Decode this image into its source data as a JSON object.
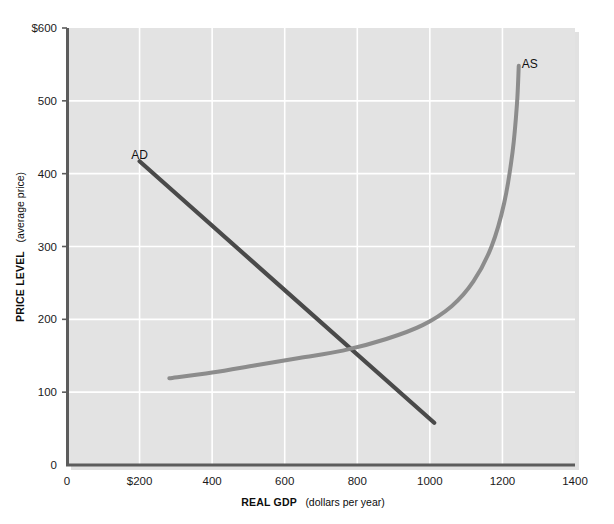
{
  "chart_data": {
    "type": "line",
    "title": "",
    "xlabel": "REAL GDP (dollars per year)",
    "xlabel_bold": "REAL GDP",
    "xlabel_paren": "(dollars per year)",
    "ylabel": "PRICE LEVEL (average price)",
    "ylabel_bold": "PRICE LEVEL",
    "ylabel_paren": "(average price)",
    "xlim": [
      0,
      1400
    ],
    "ylim": [
      0,
      600
    ],
    "xticks": [
      "0",
      "$200",
      "400",
      "600",
      "800",
      "1000",
      "1200",
      "1400"
    ],
    "xtick_values": [
      0,
      200,
      400,
      600,
      800,
      1000,
      1200,
      1400
    ],
    "yticks": [
      "0",
      "100",
      "200",
      "300",
      "400",
      "500",
      "$600"
    ],
    "ytick_values": [
      0,
      100,
      200,
      300,
      400,
      500,
      600
    ],
    "grid": true,
    "grid_color": "#ffffff",
    "plot_bg": "#e3e3e3",
    "legend_position": "inline-curve-labels",
    "series": [
      {
        "name": "AD",
        "label": "AD",
        "color": "#4a4a4a",
        "kind": "straight-line",
        "label_x": 200,
        "label_y": 420,
        "points": [
          {
            "x": 200,
            "y": 417
          },
          {
            "x": 1012,
            "y": 58
          }
        ]
      },
      {
        "name": "AS",
        "label": "AS",
        "color": "#8c8c8c",
        "kind": "curve",
        "label_x": 1275,
        "label_y": 545,
        "points": [
          {
            "x": 282,
            "y": 119
          },
          {
            "x": 400,
            "y": 127
          },
          {
            "x": 520,
            "y": 137
          },
          {
            "x": 640,
            "y": 147
          },
          {
            "x": 760,
            "y": 157
          },
          {
            "x": 880,
            "y": 173
          },
          {
            "x": 980,
            "y": 192
          },
          {
            "x": 1060,
            "y": 218
          },
          {
            "x": 1120,
            "y": 252
          },
          {
            "x": 1170,
            "y": 300
          },
          {
            "x": 1205,
            "y": 360
          },
          {
            "x": 1228,
            "y": 430
          },
          {
            "x": 1240,
            "y": 495
          },
          {
            "x": 1245,
            "y": 548
          }
        ]
      }
    ],
    "annotations": [
      {
        "name": "equilibrium",
        "x": 800,
        "y": 160,
        "visible": false
      }
    ]
  },
  "figure": {
    "ad_label": "AD",
    "as_label": "AS"
  }
}
